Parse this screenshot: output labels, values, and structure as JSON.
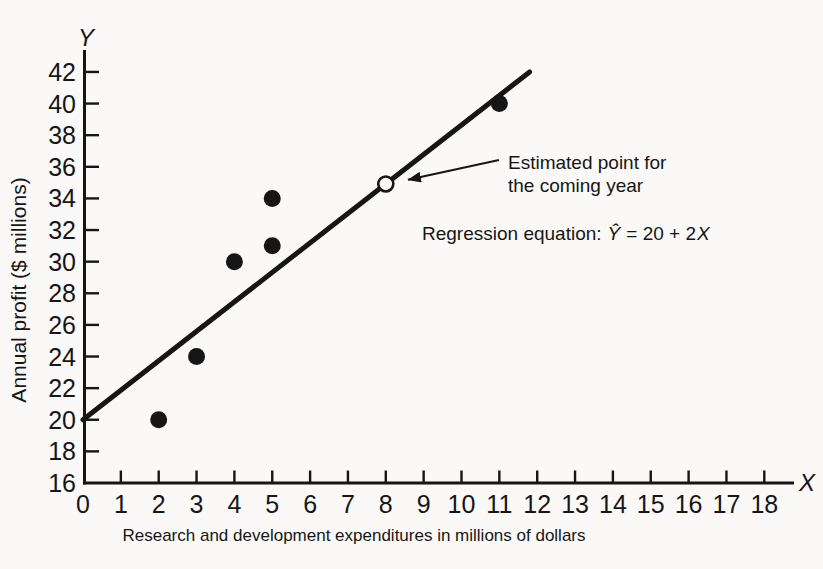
{
  "colors": {
    "paper": "#faf9f7",
    "ink": "#161616"
  },
  "chart_data": {
    "type": "scatter",
    "title": "",
    "xlabel": "Research and development expenditures in millions of dollars",
    "ylabel": "Annual profit ($ millions)",
    "x_axis_letter": "X",
    "y_axis_letter": "Y",
    "x_ticks": [
      0,
      1,
      2,
      3,
      4,
      5,
      6,
      7,
      8,
      9,
      10,
      11,
      12,
      13,
      14,
      15,
      16,
      17,
      18
    ],
    "y_ticks": [
      16,
      18,
      20,
      22,
      24,
      26,
      28,
      30,
      32,
      34,
      36,
      38,
      40,
      42
    ],
    "xlim": [
      0,
      18
    ],
    "ylim": [
      16,
      42
    ],
    "grid": false,
    "legend": "none",
    "points": [
      [
        2,
        20
      ],
      [
        3,
        24
      ],
      [
        4,
        30
      ],
      [
        5,
        31
      ],
      [
        5,
        34
      ],
      [
        11,
        40
      ]
    ],
    "regression": {
      "intercept": 20,
      "slope": 2
    },
    "drawn_line": {
      "x1": 0,
      "y1": 20,
      "x2": 11.8,
      "y2": 42
    },
    "estimated_point": {
      "x": 8,
      "y": 36,
      "marker": "open-circle"
    },
    "annotation": {
      "lines": [
        "Estimated point for",
        "the coming year"
      ]
    },
    "equation": {
      "label": "Regression equation:",
      "parts": [
        {
          "t": "Ŷ",
          "italic": true,
          "dx": 6
        },
        {
          "t": "= 20 + 2",
          "italic": false,
          "dx": 6
        },
        {
          "t": "X",
          "italic": true,
          "dx": 1
        }
      ]
    }
  }
}
